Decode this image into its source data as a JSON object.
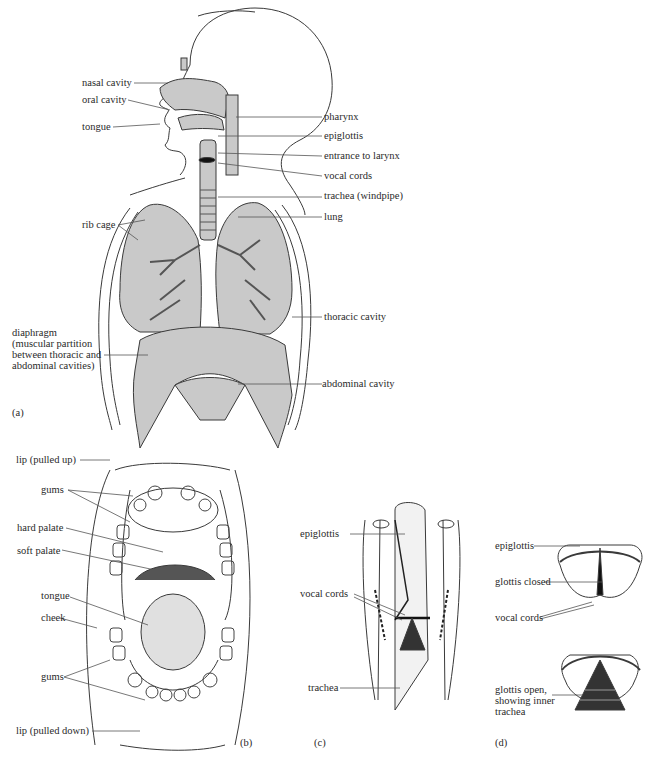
{
  "figure": {
    "panels": {
      "a": {
        "tag": "(a)",
        "labels": {
          "nasal_cavity": "nasal cavity",
          "oral_cavity": "oral cavity",
          "tongue": "tongue",
          "pharynx": "pharynx",
          "epiglottis": "epiglottis",
          "entrance_to_larynx": "entrance to larynx",
          "vocal_cords": "vocal cords",
          "trachea": "trachea (windpipe)",
          "lung": "lung",
          "rib_cage": "rib cage",
          "thoracic_cavity": "thoracic cavity",
          "diaphragm_1": "diaphragm",
          "diaphragm_2": "(muscular partition",
          "diaphragm_3": "between thoracic and",
          "diaphragm_4": "abdominal cavities)",
          "abdominal_cavity": "abdominal cavity"
        }
      },
      "b": {
        "tag": "(b)",
        "labels": {
          "lip_up": "lip (pulled up)",
          "gums_upper": "gums",
          "hard_palate": "hard palate",
          "soft_palate": "soft palate",
          "tongue": "tongue",
          "cheek": "cheek",
          "gums_lower": "gums",
          "lip_down": "lip (pulled down)"
        }
      },
      "c": {
        "tag": "(c)",
        "labels": {
          "epiglottis": "epiglottis",
          "vocal_cords": "vocal cords",
          "trachea": "trachea"
        }
      },
      "d": {
        "tag": "(d)",
        "labels": {
          "epiglottis": "epiglottis",
          "glottis_closed": "glottis closed",
          "vocal_cords": "vocal cords",
          "glottis_open_1": "glottis open,",
          "glottis_open_2": "showing inner",
          "glottis_open_3": "trachea"
        }
      }
    },
    "colors": {
      "organ_fill": "#c9c9c9",
      "line": "#3a3a3a",
      "dark": "#1a1a1a"
    }
  }
}
